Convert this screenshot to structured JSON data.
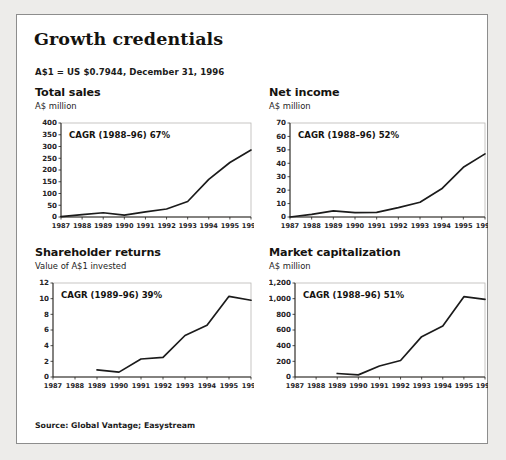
{
  "exhibit": {
    "title": "Growth credentials",
    "fx_note": "A$1 = US $0.7944, December 31, 1996",
    "source": "Source: Global Vantage; Easystream"
  },
  "panels": [
    {
      "heading": "Total sales",
      "subheading": "A$ million",
      "cagr": "CAGR (1988–96) 67%"
    },
    {
      "heading": "Net income",
      "subheading": "A$ million",
      "cagr": "CAGR (1988–96) 52%"
    },
    {
      "heading": "Shareholder returns",
      "subheading": "Value of A$1 invested",
      "cagr": "CAGR (1989–96) 39%"
    },
    {
      "heading": "Market capitalization",
      "subheading": "A$ million",
      "cagr": "CAGR (1988–96) 51%"
    }
  ],
  "chart_data": [
    {
      "type": "line",
      "title": "Total sales",
      "subtitle": "A$ million",
      "annotation": "CAGR (1988–96) 67%",
      "xlabel": "",
      "ylabel": "A$ million",
      "categories": [
        "1987",
        "1988",
        "1989",
        "1990",
        "1991",
        "1992",
        "1993",
        "1994",
        "1995",
        "1996"
      ],
      "x": [
        1987,
        1988,
        1989,
        1990,
        1991,
        1992,
        1993,
        1994,
        1995,
        1996
      ],
      "values": [
        2,
        10,
        18,
        8,
        22,
        34,
        66,
        160,
        232,
        285
      ],
      "yticks": [
        0,
        50,
        100,
        150,
        200,
        250,
        300,
        350,
        400
      ],
      "ytick_labels": [
        "0",
        "50",
        "100",
        "150",
        "200",
        "250",
        "300",
        "350",
        "400"
      ],
      "ylim": [
        0,
        400
      ],
      "grid": false,
      "legend": "none"
    },
    {
      "type": "line",
      "title": "Net income",
      "subtitle": "A$ million",
      "annotation": "CAGR (1988–96) 52%",
      "xlabel": "",
      "ylabel": "A$ million",
      "categories": [
        "1987",
        "1988",
        "1989",
        "1990",
        "1991",
        "1992",
        "1993",
        "1994",
        "1995",
        "1996"
      ],
      "x": [
        1987,
        1988,
        1989,
        1990,
        1991,
        1992,
        1993,
        1994,
        1995,
        1996
      ],
      "values": [
        -0.5,
        2,
        4.5,
        3.2,
        3.4,
        7,
        11,
        21,
        37,
        47
      ],
      "yticks": [
        0,
        10,
        20,
        30,
        40,
        50,
        60,
        70
      ],
      "ytick_labels": [
        "0",
        "10",
        "20",
        "30",
        "40",
        "50",
        "60",
        "70"
      ],
      "ylim": [
        0,
        70
      ],
      "grid": false,
      "legend": "none"
    },
    {
      "type": "line",
      "title": "Shareholder returns",
      "subtitle": "Value of A$1 invested",
      "annotation": "CAGR (1989–96) 39%",
      "xlabel": "",
      "ylabel": "Value of A$1 invested",
      "categories": [
        "1987",
        "1988",
        "1989",
        "1990",
        "1991",
        "1992",
        "1993",
        "1994",
        "1995",
        "1996"
      ],
      "x": [
        1989,
        1990,
        1991,
        1992,
        1993,
        1994,
        1995,
        1996
      ],
      "values": [
        0.9,
        0.62,
        2.3,
        2.5,
        5.3,
        6.6,
        10.3,
        9.8
      ],
      "yticks": [
        0,
        2,
        4,
        6,
        8,
        10,
        12
      ],
      "ytick_labels": [
        "0",
        "2",
        "4",
        "6",
        "8",
        "10",
        "12"
      ],
      "ylim": [
        0,
        12
      ],
      "grid": false,
      "legend": "none"
    },
    {
      "type": "line",
      "title": "Market capitalization",
      "subtitle": "A$ million",
      "annotation": "CAGR (1988–96) 51%",
      "xlabel": "",
      "ylabel": "A$ million",
      "categories": [
        "1987",
        "1988",
        "1989",
        "1990",
        "1991",
        "1992",
        "1993",
        "1994",
        "1995",
        "1996"
      ],
      "x": [
        1989,
        1990,
        1991,
        1992,
        1993,
        1994,
        1995,
        1996
      ],
      "values": [
        45,
        27,
        140,
        210,
        515,
        650,
        1025,
        990
      ],
      "yticks": [
        0,
        200,
        400,
        600,
        800,
        1000,
        1200
      ],
      "ytick_labels": [
        "0",
        "200",
        "400",
        "600",
        "800",
        "1,000",
        "1,200"
      ],
      "ylim": [
        0,
        1200
      ],
      "grid": false,
      "legend": "none"
    }
  ]
}
